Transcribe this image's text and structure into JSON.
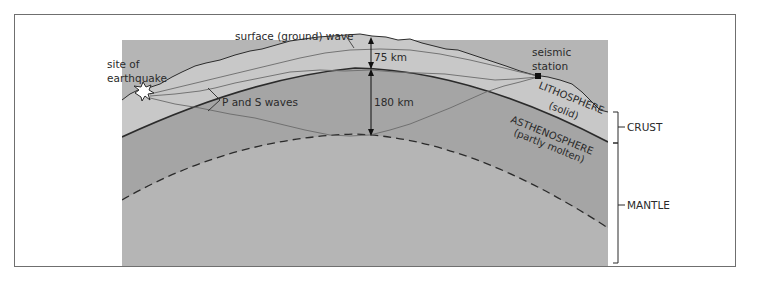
{
  "figure": {
    "labels": {
      "surface_wave": "surface (ground) wave",
      "site_of_earthquake_line1": "site of",
      "site_of_earthquake_line2": "earthquake",
      "p_and_s_waves": "P and S waves",
      "lithosphere_thickness": "75 km",
      "asthenosphere_depth": "180 km",
      "seismic_station_line1": "seismic",
      "seismic_station_line2": "station",
      "lithosphere": "LITHOSPHERE",
      "lithosphere_state": "(solid)",
      "asthenosphere": "ASTHENOSPHERE",
      "asthenosphere_state": "(partly molten)",
      "crust": "CRUST",
      "mantle": "MANTLE"
    },
    "colors": {
      "lithosphere_fill": "#c8c8c8",
      "asthenosphere_fill": "#a5a5a5",
      "mantle_fill": "#b5b5b5",
      "outline": "#2b2b2b",
      "wave_line": "#6a6a6a",
      "frame": "#6f6f6f"
    }
  }
}
